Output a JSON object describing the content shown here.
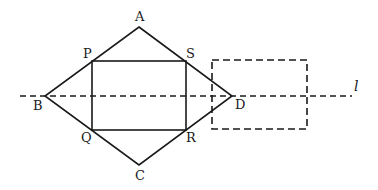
{
  "diagram": {
    "colors": {
      "stroke": "#1a1a1a",
      "background": "#ffffff"
    },
    "points": {
      "A": {
        "label": "A",
        "x": 139,
        "y": 27
      },
      "B": {
        "label": "B",
        "x": 45,
        "y": 96
      },
      "C": {
        "label": "C",
        "x": 139,
        "y": 165
      },
      "D": {
        "label": "D",
        "x": 232,
        "y": 96
      },
      "P": {
        "label": "P",
        "x": 92,
        "y": 61
      },
      "S": {
        "label": "S",
        "x": 186,
        "y": 61
      },
      "Q": {
        "label": "Q",
        "x": 92,
        "y": 130
      },
      "R": {
        "label": "R",
        "x": 186,
        "y": 130
      }
    },
    "line_l": {
      "label": "l",
      "style": "dashed"
    },
    "dashed_rectangle": {
      "style": "dashed"
    }
  }
}
